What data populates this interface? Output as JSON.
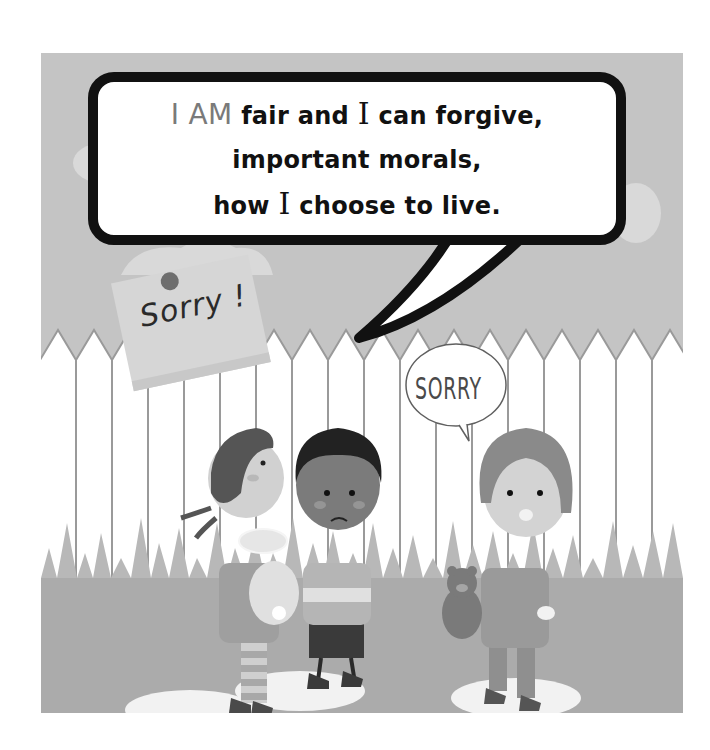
{
  "speech_bubble": {
    "line1_prefix": "I AM",
    "line1_rest_a": "fair and",
    "line1_i": "I",
    "line1_rest_b": "can forgive,",
    "line2": "important morals,",
    "line3_a": "how",
    "line3_i": "I",
    "line3_b": "choose to live."
  },
  "sticky_note": {
    "text": "Sorry !"
  },
  "child_speech": {
    "text": "SORRY"
  },
  "colors": {
    "background": "#c4c4c4",
    "fence": "#ffffff",
    "grass": "#b8b8b8",
    "ground": "#a9a9a9",
    "bubble_border": "#111111",
    "iam_text": "#7a7a7a"
  }
}
